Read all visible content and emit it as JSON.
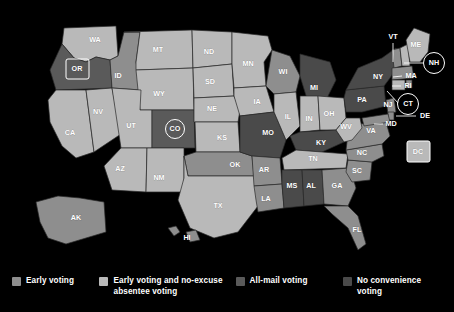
{
  "map": {
    "title": "US voting methods by state",
    "colors": {
      "early_voting": "#8e8e8e",
      "early_voting_and_no_excuse_absentee": "#b9b9b9",
      "all_mail_voting": "#5a5a5a",
      "no_convenience_voting": "#4a4a4a",
      "background": "#000000",
      "label": "#ffffff",
      "border": "#2a2a2a"
    },
    "states": [
      {
        "code": "WA",
        "category": "early_voting_and_no_excuse_absentee",
        "label_x": 95,
        "label_y": 40
      },
      {
        "code": "OR",
        "category": "all_mail_voting",
        "label_x": 77,
        "label_y": 69,
        "marker": "box"
      },
      {
        "code": "ID",
        "category": "early_voting",
        "label_x": 118,
        "label_y": 76
      },
      {
        "code": "MT",
        "category": "early_voting_and_no_excuse_absentee",
        "label_x": 158,
        "label_y": 50
      },
      {
        "code": "WY",
        "category": "early_voting_and_no_excuse_absentee",
        "label_x": 159,
        "label_y": 94
      },
      {
        "code": "NV",
        "category": "early_voting_and_no_excuse_absentee",
        "label_x": 98,
        "label_y": 112
      },
      {
        "code": "UT",
        "category": "early_voting_and_no_excuse_absentee",
        "label_x": 131,
        "label_y": 126
      },
      {
        "code": "CA",
        "category": "early_voting_and_no_excuse_absentee",
        "label_x": 70,
        "label_y": 133
      },
      {
        "code": "CO",
        "category": "all_mail_voting",
        "label_x": 175,
        "label_y": 129,
        "marker": "circle"
      },
      {
        "code": "AZ",
        "category": "early_voting_and_no_excuse_absentee",
        "label_x": 120,
        "label_y": 169
      },
      {
        "code": "NM",
        "category": "early_voting_and_no_excuse_absentee",
        "label_x": 159,
        "label_y": 178
      },
      {
        "code": "ND",
        "category": "early_voting_and_no_excuse_absentee",
        "label_x": 209,
        "label_y": 52
      },
      {
        "code": "SD",
        "category": "early_voting_and_no_excuse_absentee",
        "label_x": 210,
        "label_y": 82
      },
      {
        "code": "NE",
        "category": "early_voting_and_no_excuse_absentee",
        "label_x": 212,
        "label_y": 109
      },
      {
        "code": "KS",
        "category": "early_voting_and_no_excuse_absentee",
        "label_x": 222,
        "label_y": 138
      },
      {
        "code": "OK",
        "category": "early_voting",
        "label_x": 235,
        "label_y": 165
      },
      {
        "code": "TX",
        "category": "early_voting_and_no_excuse_absentee",
        "label_x": 218,
        "label_y": 206
      },
      {
        "code": "MN",
        "category": "early_voting_and_no_excuse_absentee",
        "label_x": 248,
        "label_y": 64
      },
      {
        "code": "IA",
        "category": "early_voting_and_no_excuse_absentee",
        "label_x": 257,
        "label_y": 102
      },
      {
        "code": "MO",
        "category": "no_convenience_voting",
        "label_x": 268,
        "label_y": 133
      },
      {
        "code": "AR",
        "category": "early_voting",
        "label_x": 264,
        "label_y": 170
      },
      {
        "code": "LA",
        "category": "early_voting",
        "label_x": 266,
        "label_y": 199
      },
      {
        "code": "WI",
        "category": "early_voting",
        "label_x": 283,
        "label_y": 72
      },
      {
        "code": "IL",
        "category": "early_voting_and_no_excuse_absentee",
        "label_x": 288,
        "label_y": 117
      },
      {
        "code": "MI",
        "category": "no_convenience_voting",
        "label_x": 314,
        "label_y": 88
      },
      {
        "code": "IN",
        "category": "early_voting_and_no_excuse_absentee",
        "label_x": 309,
        "label_y": 119
      },
      {
        "code": "OH",
        "category": "early_voting_and_no_excuse_absentee",
        "label_x": 329,
        "label_y": 114
      },
      {
        "code": "KY",
        "category": "no_convenience_voting",
        "label_x": 321,
        "label_y": 143
      },
      {
        "code": "TN",
        "category": "early_voting_and_no_excuse_absentee",
        "label_x": 313,
        "label_y": 159
      },
      {
        "code": "MS",
        "category": "no_convenience_voting",
        "label_x": 292,
        "label_y": 186
      },
      {
        "code": "AL",
        "category": "no_convenience_voting",
        "label_x": 311,
        "label_y": 186
      },
      {
        "code": "GA",
        "category": "early_voting",
        "label_x": 337,
        "label_y": 186
      },
      {
        "code": "FL",
        "category": "early_voting",
        "label_x": 357,
        "label_y": 230
      },
      {
        "code": "SC",
        "category": "early_voting",
        "label_x": 357,
        "label_y": 171
      },
      {
        "code": "NC",
        "category": "early_voting",
        "label_x": 362,
        "label_y": 153
      },
      {
        "code": "VA",
        "category": "early_voting",
        "label_x": 371,
        "label_y": 131
      },
      {
        "code": "WV",
        "category": "early_voting_and_no_excuse_absentee",
        "label_x": 346,
        "label_y": 127
      },
      {
        "code": "PA",
        "category": "no_convenience_voting",
        "label_x": 362,
        "label_y": 100
      },
      {
        "code": "NY",
        "category": "no_convenience_voting",
        "label_x": 378,
        "label_y": 77
      },
      {
        "code": "ME",
        "category": "early_voting_and_no_excuse_absentee",
        "label_x": 416,
        "label_y": 45
      },
      {
        "code": "AK",
        "category": "early_voting",
        "label_x": 76,
        "label_y": 218
      },
      {
        "code": "HI",
        "category": "early_voting",
        "label_x": 187,
        "label_y": 238
      }
    ],
    "callouts": [
      {
        "code": "VT",
        "category": "early_voting",
        "label_x": 393,
        "label_y": 37,
        "marker": "none",
        "line": "M393,43 L393,63"
      },
      {
        "code": "NH",
        "category": "early_voting_and_no_excuse_absentee",
        "label_x": 434,
        "label_y": 63,
        "marker": "circle",
        "line": "M404,63 L423,63"
      },
      {
        "code": "MA",
        "category": "early_voting",
        "label_x": 411,
        "label_y": 76,
        "marker": "none",
        "line": "M391,78 L402,76"
      },
      {
        "code": "RI",
        "category": "early_voting",
        "label_x": 408,
        "label_y": 86,
        "marker": "none",
        "line": "M392,86 L400,86"
      },
      {
        "code": "CT",
        "category": "early_voting_and_no_excuse_absentee",
        "label_x": 408,
        "label_y": 104,
        "marker": "circle",
        "line": "M387,90 L399,103"
      },
      {
        "code": "NJ",
        "category": "early_voting",
        "label_x": 388,
        "label_y": 105,
        "marker": "none",
        "line": ""
      },
      {
        "code": "DE",
        "category": "early_voting",
        "label_x": 424,
        "label_y": 116,
        "marker": "none",
        "line": "M392,116 L415,116"
      },
      {
        "code": "MD",
        "category": "early_voting",
        "label_x": 391,
        "label_y": 124,
        "marker": "none",
        "line": "M377,124 L383,124"
      },
      {
        "code": "DC",
        "category": "early_voting_and_no_excuse_absentee",
        "label_x": 418,
        "label_y": 152,
        "marker": "box",
        "line": ""
      }
    ]
  },
  "legend": {
    "items": [
      {
        "label": "Early voting",
        "color_key": "sw-early"
      },
      {
        "label": "Early voting and no-excuse absentee voting",
        "color_key": "sw-early-abs"
      },
      {
        "label": "All-mail voting",
        "color_key": "sw-allmail"
      },
      {
        "label": "No convenience voting",
        "color_key": "sw-noconv"
      }
    ]
  }
}
